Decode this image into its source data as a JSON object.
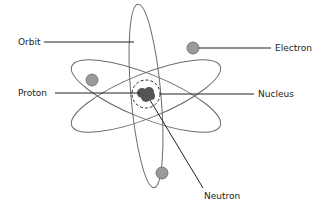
{
  "diagram": {
    "labels": {
      "orbit": "Orbit",
      "electron": "Electron",
      "proton": "Proton",
      "nucleus": "Nucleus",
      "neutron": "Neutron"
    },
    "colors": {
      "orbit_stroke": "#6b6b6b",
      "electron_fill": "#9a9a9a",
      "nucleus_fill": "#555555",
      "leader_line": "#222222"
    }
  }
}
